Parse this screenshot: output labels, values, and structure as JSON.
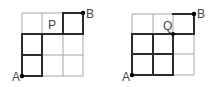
{
  "diagrams": [
    {
      "name": "grid-p",
      "origin": {
        "x": 22,
        "y": 76
      },
      "cell": 20.3,
      "size": 3,
      "labels": {
        "start": "A",
        "end": "B",
        "point": "P"
      },
      "point_cell_label_pos": {
        "col": 1,
        "row": 2
      },
      "bold_segments": [
        [
          [
            0,
            0
          ],
          [
            1,
            0
          ]
        ],
        [
          [
            0,
            0
          ],
          [
            0,
            2
          ]
        ],
        [
          [
            1,
            0
          ],
          [
            1,
            2
          ]
        ],
        [
          [
            0,
            1
          ],
          [
            1,
            1
          ]
        ],
        [
          [
            0,
            2
          ],
          [
            3,
            2
          ]
        ],
        [
          [
            2,
            2
          ],
          [
            2,
            3
          ]
        ],
        [
          [
            2,
            3
          ],
          [
            3,
            3
          ]
        ],
        [
          [
            3,
            2
          ],
          [
            3,
            3
          ]
        ]
      ]
    },
    {
      "name": "grid-q",
      "origin": {
        "x": 132,
        "y": 75
      },
      "cell": 20.5,
      "size": 3,
      "labels": {
        "start": "A",
        "end": "B",
        "point": "Q"
      },
      "point_node": {
        "col": 2,
        "row": 2
      },
      "bold_segments": [
        [
          [
            0,
            0
          ],
          [
            2,
            0
          ]
        ],
        [
          [
            0,
            0
          ],
          [
            0,
            2
          ]
        ],
        [
          [
            1,
            0
          ],
          [
            1,
            2
          ]
        ],
        [
          [
            2,
            0
          ],
          [
            2,
            2
          ]
        ],
        [
          [
            0,
            1
          ],
          [
            2,
            1
          ]
        ],
        [
          [
            0,
            2
          ],
          [
            3,
            2
          ]
        ],
        [
          [
            2,
            3
          ],
          [
            3,
            3
          ]
        ],
        [
          [
            3,
            2
          ],
          [
            3,
            3
          ]
        ]
      ]
    }
  ],
  "colors": {
    "grid": "#a6a6a6",
    "bold": "#2b2b2b",
    "text": "#444444"
  }
}
